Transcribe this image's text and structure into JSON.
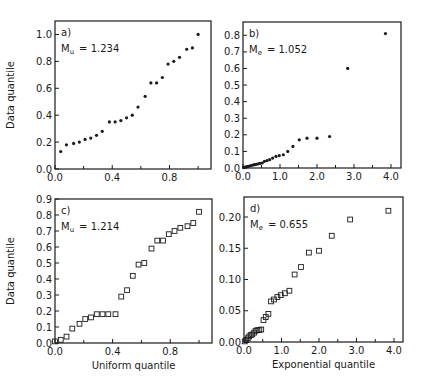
{
  "figure": {
    "background": "#ffffff",
    "ink": "#1a1a1a"
  },
  "chart_data": [
    {
      "id": "a",
      "type": "scatter",
      "panel_label": "a)",
      "annotation": "M_u = 1.234",
      "annotation_main": "M",
      "annotation_sub": "u",
      "annotation_value": "=  1.234",
      "xlabel": "",
      "ylabel": "Data quantile",
      "xlim": [
        0,
        1.09
      ],
      "ylim": [
        0,
        1.1
      ],
      "xticks": [
        0.0,
        0.4,
        0.8
      ],
      "xtick_labels": [
        "0.0",
        "0.4",
        "0.8"
      ],
      "xminor": [
        0.2,
        0.6,
        1.0
      ],
      "yticks": [
        0.0,
        0.2,
        0.4,
        0.6,
        0.8,
        1.0
      ],
      "ytick_labels": [
        "0.0",
        "0.2",
        "0.4",
        "0.6",
        "0.8",
        "1.0"
      ],
      "marker": "filled-dot",
      "frame": {
        "x": 55,
        "y": 21,
        "w": 156,
        "h": 148
      },
      "points": [
        [
          0.04,
          0.13
        ],
        [
          0.08,
          0.18
        ],
        [
          0.13,
          0.19
        ],
        [
          0.17,
          0.2
        ],
        [
          0.21,
          0.22
        ],
        [
          0.25,
          0.23
        ],
        [
          0.29,
          0.25
        ],
        [
          0.33,
          0.28
        ],
        [
          0.38,
          0.35
        ],
        [
          0.42,
          0.35
        ],
        [
          0.46,
          0.36
        ],
        [
          0.5,
          0.38
        ],
        [
          0.54,
          0.4
        ],
        [
          0.58,
          0.46
        ],
        [
          0.63,
          0.54
        ],
        [
          0.67,
          0.64
        ],
        [
          0.71,
          0.64
        ],
        [
          0.75,
          0.68
        ],
        [
          0.79,
          0.78
        ],
        [
          0.83,
          0.8
        ],
        [
          0.87,
          0.83
        ],
        [
          0.92,
          0.89
        ],
        [
          0.96,
          0.9
        ],
        [
          1.0,
          1.0
        ]
      ]
    },
    {
      "id": "b",
      "type": "scatter",
      "panel_label": "b)",
      "annotation": "M_e = 1.052",
      "annotation_main": "M",
      "annotation_sub": "e",
      "annotation_value": "=  1.052",
      "xlabel": "",
      "ylabel": "",
      "xlim": [
        0,
        4.27
      ],
      "ylim": [
        0,
        0.88
      ],
      "xticks": [
        0.0,
        1.0,
        2.0,
        3.0,
        4.0
      ],
      "xtick_labels": [
        "0.0",
        "1.0",
        "2.0",
        "3.0",
        "4.0"
      ],
      "xminor": [
        0.5,
        1.5,
        2.5,
        3.5
      ],
      "yticks": [
        0.0,
        0.1,
        0.2,
        0.3,
        0.4,
        0.5,
        0.6,
        0.7,
        0.8
      ],
      "ytick_labels": [
        "0.0",
        "0.1",
        "0.2",
        "0.3",
        "0.4",
        "0.5",
        "0.6",
        "0.7",
        "0.8"
      ],
      "marker": "filled-dot",
      "frame": {
        "x": 243,
        "y": 22,
        "w": 158,
        "h": 146
      },
      "points": [
        [
          0.02,
          0.002
        ],
        [
          0.06,
          0.005
        ],
        [
          0.1,
          0.008
        ],
        [
          0.14,
          0.01
        ],
        [
          0.18,
          0.012
        ],
        [
          0.22,
          0.015
        ],
        [
          0.27,
          0.018
        ],
        [
          0.31,
          0.02
        ],
        [
          0.36,
          0.022
        ],
        [
          0.41,
          0.025
        ],
        [
          0.46,
          0.028
        ],
        [
          0.52,
          0.03
        ],
        [
          0.58,
          0.04
        ],
        [
          0.65,
          0.045
        ],
        [
          0.72,
          0.05
        ],
        [
          0.8,
          0.06
        ],
        [
          0.89,
          0.07
        ],
        [
          0.98,
          0.075
        ],
        [
          1.09,
          0.08
        ],
        [
          1.21,
          0.1
        ],
        [
          1.35,
          0.13
        ],
        [
          1.52,
          0.17
        ],
        [
          1.73,
          0.18
        ],
        [
          2.0,
          0.18
        ],
        [
          2.34,
          0.19
        ],
        [
          2.83,
          0.6
        ],
        [
          3.85,
          0.81
        ]
      ]
    },
    {
      "id": "c",
      "type": "scatter",
      "panel_label": "c)",
      "annotation": "M_u = 1.214",
      "annotation_main": "M",
      "annotation_sub": "u",
      "annotation_value": "=  1.214",
      "xlabel": "Uniform quantile",
      "ylabel": "Data quantile",
      "xlim": [
        0,
        1.09
      ],
      "ylim": [
        0,
        0.9
      ],
      "xticks": [
        0.0,
        0.4,
        0.8
      ],
      "xtick_labels": [
        "0.0",
        "0.4",
        "0.8"
      ],
      "xminor": [
        0.2,
        0.6,
        1.0
      ],
      "yticks": [
        0.0,
        0.1,
        0.2,
        0.3,
        0.4,
        0.5,
        0.6,
        0.7,
        0.8,
        0.9
      ],
      "ytick_labels": [
        "0.0",
        "0.1",
        "0.2",
        "0.3",
        "0.4",
        "0.5",
        "0.6",
        "0.7",
        "0.8",
        "0.9"
      ],
      "marker": "open-square",
      "frame": {
        "x": 55,
        "y": 199,
        "w": 157,
        "h": 144
      },
      "points": [
        [
          0.0,
          0.01
        ],
        [
          0.04,
          0.02
        ],
        [
          0.08,
          0.04
        ],
        [
          0.12,
          0.09
        ],
        [
          0.17,
          0.12
        ],
        [
          0.21,
          0.15
        ],
        [
          0.25,
          0.16
        ],
        [
          0.29,
          0.18
        ],
        [
          0.33,
          0.18
        ],
        [
          0.37,
          0.18
        ],
        [
          0.42,
          0.18
        ],
        [
          0.46,
          0.29
        ],
        [
          0.5,
          0.33
        ],
        [
          0.54,
          0.42
        ],
        [
          0.58,
          0.49
        ],
        [
          0.62,
          0.5
        ],
        [
          0.67,
          0.59
        ],
        [
          0.71,
          0.64
        ],
        [
          0.75,
          0.64
        ],
        [
          0.79,
          0.68
        ],
        [
          0.83,
          0.7
        ],
        [
          0.87,
          0.72
        ],
        [
          0.92,
          0.73
        ],
        [
          0.96,
          0.75
        ],
        [
          1.0,
          0.82
        ]
      ]
    },
    {
      "id": "d",
      "type": "scatter",
      "panel_label": "d)",
      "annotation": "M_e = 0.655",
      "annotation_main": "M",
      "annotation_sub": "e",
      "annotation_value": "=  0.655",
      "xlabel": "Exponential quantile",
      "ylabel": "",
      "xlim": [
        0,
        4.24
      ],
      "ylim": [
        0,
        0.232
      ],
      "xticks": [
        0.0,
        1.0,
        2.0,
        3.0,
        4.0
      ],
      "xtick_labels": [
        "0.0",
        "1.0",
        "2.0",
        "3.0",
        "4.0"
      ],
      "xminor": [
        0.5,
        1.5,
        2.5,
        3.5
      ],
      "yticks": [
        0.0,
        0.05,
        0.1,
        0.15,
        0.2
      ],
      "ytick_labels": [
        "0.00",
        "0.05",
        "0.10",
        "0.15",
        "0.20"
      ],
      "marker": "open-square",
      "frame": {
        "x": 244,
        "y": 197,
        "w": 159,
        "h": 145
      },
      "points": [
        [
          0.02,
          0.001
        ],
        [
          0.06,
          0.003
        ],
        [
          0.1,
          0.006
        ],
        [
          0.14,
          0.009
        ],
        [
          0.18,
          0.011
        ],
        [
          0.22,
          0.012
        ],
        [
          0.27,
          0.015
        ],
        [
          0.31,
          0.018
        ],
        [
          0.36,
          0.019
        ],
        [
          0.41,
          0.019
        ],
        [
          0.46,
          0.02
        ],
        [
          0.52,
          0.035
        ],
        [
          0.58,
          0.04
        ],
        [
          0.65,
          0.045
        ],
        [
          0.72,
          0.065
        ],
        [
          0.8,
          0.068
        ],
        [
          0.89,
          0.072
        ],
        [
          0.98,
          0.075
        ],
        [
          1.09,
          0.078
        ],
        [
          1.21,
          0.082
        ],
        [
          1.35,
          0.108
        ],
        [
          1.52,
          0.12
        ],
        [
          1.73,
          0.143
        ],
        [
          2.0,
          0.146
        ],
        [
          2.34,
          0.17
        ],
        [
          2.83,
          0.196
        ],
        [
          3.85,
          0.21
        ]
      ]
    }
  ]
}
